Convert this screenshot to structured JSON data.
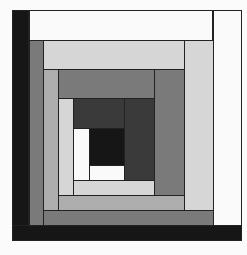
{
  "figure": {
    "colors": {
      "black": "#161616",
      "white": "#fafafa",
      "mid_gray": "#7a7a7a",
      "light_gray": "#d6d6d6",
      "light_dotted": "#bdbdbd",
      "dark_gray": "#3a3a3a",
      "outline": "#222222"
    },
    "pieces": [
      {
        "name": "outer-left-strip",
        "shade": "black",
        "x": 12,
        "y": 10,
        "w": 17,
        "h": 231
      },
      {
        "name": "outer-bottom-strip",
        "shade": "black",
        "x": 12,
        "y": 225,
        "w": 230,
        "h": 16
      },
      {
        "name": "outer-top-strip",
        "shade": "white",
        "x": 29,
        "y": 10,
        "w": 184,
        "h": 30
      },
      {
        "name": "outer-right-strip",
        "shade": "white",
        "x": 213,
        "y": 10,
        "w": 29,
        "h": 215
      },
      {
        "name": "ring3-left-strip",
        "shade": "mid_gray",
        "x": 29,
        "y": 40,
        "w": 14,
        "h": 185
      },
      {
        "name": "ring3-bottom-strip",
        "shade": "mid_gray",
        "x": 43,
        "y": 210,
        "w": 170,
        "h": 15
      },
      {
        "name": "ring3-top-strip",
        "shade": "light_gray",
        "x": 43,
        "y": 40,
        "w": 141,
        "h": 29
      },
      {
        "name": "ring3-right-strip",
        "shade": "light_gray",
        "x": 184,
        "y": 40,
        "w": 29,
        "h": 170
      },
      {
        "name": "ring2-left-strip",
        "shade": "light_dotted",
        "x": 43,
        "y": 69,
        "w": 15,
        "h": 141
      },
      {
        "name": "ring2-bottom-strip",
        "shade": "light_dotted",
        "x": 58,
        "y": 195,
        "w": 126,
        "h": 15
      },
      {
        "name": "ring2-top-strip",
        "shade": "mid_gray",
        "x": 58,
        "y": 69,
        "w": 96,
        "h": 29
      },
      {
        "name": "ring2-right-strip",
        "shade": "mid_gray",
        "x": 154,
        "y": 69,
        "w": 30,
        "h": 126
      },
      {
        "name": "ring1-left-strip",
        "shade": "light_gray",
        "x": 58,
        "y": 98,
        "w": 15,
        "h": 97
      },
      {
        "name": "ring1-bottom-strip",
        "shade": "light_gray",
        "x": 73,
        "y": 180,
        "w": 81,
        "h": 15
      },
      {
        "name": "ring1-top-strip",
        "shade": "dark_gray",
        "x": 73,
        "y": 98,
        "w": 51,
        "h": 30
      },
      {
        "name": "ring1-right-strip",
        "shade": "dark_gray",
        "x": 124,
        "y": 98,
        "w": 30,
        "h": 82
      },
      {
        "name": "ring0-left-strip",
        "shade": "white",
        "x": 73,
        "y": 128,
        "w": 16,
        "h": 52
      },
      {
        "name": "ring0-bottom-strip",
        "shade": "white",
        "x": 89,
        "y": 165,
        "w": 35,
        "h": 15
      },
      {
        "name": "center-square",
        "shade": "black",
        "x": 89,
        "y": 128,
        "w": 35,
        "h": 37
      }
    ]
  }
}
